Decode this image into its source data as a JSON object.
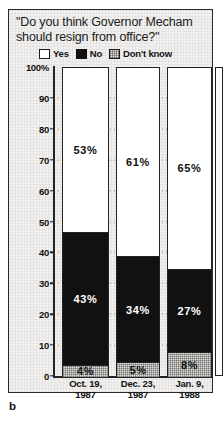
{
  "figure": {
    "letter": "b"
  },
  "chart_data": {
    "type": "bar",
    "subtype": "stacked-100-percent",
    "title": "\"Do you think Governor Mecham should resign from office?\"",
    "xlabel": "",
    "ylabel": "",
    "ylim": [
      0,
      100
    ],
    "grid": true,
    "legend_position": "top",
    "categories": [
      "Oct. 19,\n1987",
      "Dec. 23,\n1987",
      "Jan. 9,\n1988"
    ],
    "category_lines": [
      [
        "Oct. 19,",
        "1987"
      ],
      [
        "Dec. 23,",
        "1987"
      ],
      [
        "Jan. 9,",
        "1988"
      ]
    ],
    "series": [
      {
        "name": "Yes",
        "color": "#ffffff",
        "values": [
          53,
          61,
          65
        ],
        "labels": [
          "53%",
          "61%",
          "65%"
        ]
      },
      {
        "name": "No",
        "color": "#111111",
        "values": [
          43,
          34,
          27
        ],
        "labels": [
          "43%",
          "34%",
          "27%"
        ]
      },
      {
        "name": "Don't know",
        "color": "#dfdedb",
        "values": [
          4,
          5,
          8
        ],
        "labels": [
          "4%",
          "5%",
          "8%"
        ]
      }
    ],
    "yticks": [
      {
        "value": 100,
        "label": "100%"
      },
      {
        "value": 90,
        "label": "90"
      },
      {
        "value": 80,
        "label": "80"
      },
      {
        "value": 70,
        "label": "70"
      },
      {
        "value": 60,
        "label": "60"
      },
      {
        "value": 50,
        "label": "50"
      },
      {
        "value": 40,
        "label": "40"
      },
      {
        "value": 30,
        "label": "30"
      },
      {
        "value": 20,
        "label": "20"
      },
      {
        "value": 10,
        "label": "10"
      },
      {
        "value": 0,
        "label": "0"
      }
    ]
  }
}
